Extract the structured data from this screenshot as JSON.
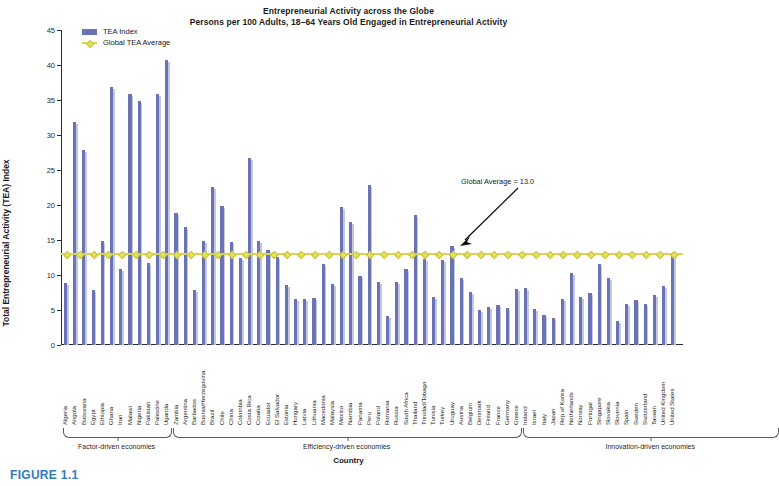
{
  "figure": {
    "caption": "FIGURE 1.1",
    "title": "Entrepreneurial Activity across the Globe",
    "subtitle": "Persons per 100 Adults, 18–64 Years Old Engaged in Entrepreneurial Activity"
  },
  "legend": {
    "position": "top-left",
    "items": [
      {
        "label": "TEA Index",
        "marker": "bar-swatch",
        "color": "#6a74b4"
      },
      {
        "label": "Global TEA Average",
        "marker": "line-diamond",
        "color": "#d9d64a"
      }
    ]
  },
  "annotation": {
    "text": "Global Average = 13.0",
    "points_to": "global-average-line"
  },
  "groups": [
    {
      "key": "factor",
      "label": "Factor-driven economies",
      "start": 0,
      "count": 12
    },
    {
      "key": "efficiency",
      "label": "Efficiency-driven economies",
      "start": 12,
      "count": 38
    },
    {
      "key": "innovation",
      "label": "Innovation-driven economies",
      "start": 50,
      "count": 28
    }
  ],
  "chart_data": {
    "type": "bar",
    "title": "Entrepreneurial Activity across the Globe",
    "subtitle": "Persons per 100 Adults, 18–64 Years Old Engaged in Entrepreneurial Activity",
    "xlabel": "Country",
    "ylabel": "Total Entrepreneurial Activity (TEA) Index",
    "ylim": [
      0,
      45
    ],
    "yticks": [
      0,
      5,
      10,
      15,
      20,
      25,
      30,
      35,
      40,
      45
    ],
    "grid": false,
    "bar_color": "#6a74b4",
    "average_line": {
      "name": "Global TEA Average",
      "value": 13.0,
      "color": "#d9d64a"
    },
    "categories": [
      "Algeria",
      "Angola",
      "Botswana",
      "Egypt",
      "Ethiopia",
      "Ghana",
      "Iran",
      "Malawi",
      "Nigeria",
      "Pakistan",
      "Palestine",
      "Uganda",
      "Zambia",
      "Argentina",
      "Barbados",
      "Bosnia/Herzegovina",
      "Brazil",
      "Chile",
      "China",
      "Colombia",
      "Costa Rica",
      "Croatia",
      "Ecuador",
      "El Salvador",
      "Estonia",
      "Hungary",
      "Latvia",
      "Lithuania",
      "Macedonia",
      "Malaysia",
      "Mexico",
      "Namibia",
      "Panama",
      "Peru",
      "Poland",
      "Romania",
      "Russia",
      "South Africa",
      "Thailand",
      "Trinidad/Tobago",
      "Tunisia",
      "Turkey",
      "Uruguay",
      "Austria",
      "Belgium",
      "Denmark",
      "Finland",
      "France",
      "Germany",
      "Greece",
      "Ireland",
      "Israel",
      "Italy",
      "Japan",
      "Rep of Korea",
      "Netherlands",
      "Norway",
      "Portugal",
      "Singapore",
      "Slovakia",
      "Slovenia",
      "Spain",
      "Sweden",
      "Switzerland",
      "Taiwan",
      "United Kingdom",
      "United States"
    ],
    "values": [
      8.9,
      31.9,
      27.9,
      7.9,
      14.9,
      36.8,
      10.8,
      35.8,
      34.8,
      11.7,
      35.8,
      40.7,
      18.9,
      16.8,
      7.8,
      14.8,
      22.6,
      19.8,
      14.7,
      12.5,
      26.7,
      14.8,
      13.6,
      12.6,
      8.6,
      6.6,
      6.6,
      6.7,
      11.6,
      8.7,
      19.7,
      17.6,
      9.8,
      22.9,
      9.0,
      4.2,
      9.0,
      10.8,
      18.6,
      12.3,
      6.9,
      12.2,
      14.2,
      9.6,
      7.6,
      5.0,
      5.4,
      5.7,
      5.3,
      8.0,
      8.1,
      5.1,
      4.3,
      3.9,
      6.6,
      10.3,
      6.9,
      7.5,
      11.6,
      9.6,
      3.4,
      5.8,
      6.5,
      5.9,
      7.1,
      8.5,
      12.7
    ]
  }
}
